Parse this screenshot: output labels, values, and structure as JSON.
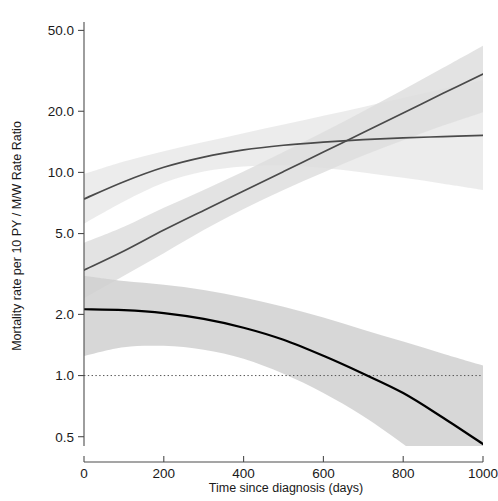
{
  "chart_data": {
    "type": "line",
    "title": "",
    "subtitle": "",
    "xlabel": "Time since diagnosis (days)",
    "ylabel": "Mortality rate per 10 PY / M/W Rate Ratio",
    "xlim": [
      0,
      1000
    ],
    "ylim": [
      0.45,
      55.0
    ],
    "yscale": "log",
    "xscale": "linear",
    "grid": false,
    "legend": null,
    "xticks": [
      0,
      200,
      400,
      600,
      800,
      1000
    ],
    "xtick_labels": [
      "0",
      "200",
      "400",
      "600",
      "800",
      "1000"
    ],
    "yticks": [
      0.5,
      1.0,
      2.0,
      5.0,
      10.0,
      20.0,
      50.0
    ],
    "ytick_labels": [
      "0.5",
      "1.0",
      "2.0",
      "5.0",
      "10.0",
      "20.0",
      "50.0"
    ],
    "reference_lines": [
      {
        "name": "null-ratio-line",
        "axis": "y",
        "value": 1.0,
        "style": "dotted",
        "color": "#555555"
      }
    ],
    "colors": {
      "men_rate_line": "#4a4a4a",
      "women_rate_line": "#4a4a4a",
      "rate_ratio_line": "#000000",
      "band_light": "#ebebeb",
      "band_mid": "#dedede",
      "band_dark": "#d0d0d0"
    },
    "series": [
      {
        "name": "Mortality rate men (per 10 PY)",
        "line_color": "#4a4a4a",
        "line_style": "solid",
        "x": [
          0,
          100,
          200,
          300,
          400,
          500,
          600,
          700,
          800,
          900,
          1000
        ],
        "values": [
          7.4,
          9.0,
          10.6,
          11.9,
          12.9,
          13.6,
          14.1,
          14.5,
          14.8,
          15.0,
          15.2
        ],
        "ci_lower": [
          5.6,
          7.2,
          8.9,
          10.1,
          10.7,
          10.8,
          10.5,
          10.0,
          9.4,
          8.8,
          8.2
        ],
        "ci_upper": [
          9.8,
          11.3,
          12.7,
          14.1,
          15.6,
          17.2,
          19.0,
          21.0,
          23.3,
          25.8,
          28.5
        ]
      },
      {
        "name": "Mortality rate women (per 10 PY)",
        "line_color": "#4a4a4a",
        "line_style": "solid",
        "x": [
          0,
          100,
          200,
          300,
          400,
          500,
          600,
          700,
          800,
          900,
          1000
        ],
        "values": [
          3.3,
          4.1,
          5.2,
          6.5,
          8.1,
          10.1,
          12.6,
          15.7,
          19.6,
          24.5,
          30.5
        ],
        "ci_lower": [
          2.4,
          3.1,
          4.0,
          5.2,
          6.6,
          8.2,
          10.0,
          12.1,
          14.4,
          17.0,
          19.8
        ],
        "ci_upper": [
          4.5,
          5.4,
          6.7,
          8.2,
          10.1,
          12.6,
          15.8,
          20.0,
          25.5,
          32.7,
          42.0
        ]
      },
      {
        "name": "M/W Rate Ratio",
        "line_color": "#000000",
        "line_style": "solid",
        "x": [
          0,
          100,
          200,
          300,
          400,
          500,
          600,
          700,
          800,
          900,
          1000
        ],
        "values": [
          2.12,
          2.1,
          2.03,
          1.9,
          1.72,
          1.5,
          1.25,
          1.02,
          0.82,
          0.62,
          0.46
        ],
        "ci_lower": [
          1.25,
          1.38,
          1.4,
          1.34,
          1.21,
          1.02,
          0.82,
          0.63,
          0.46,
          0.33,
          0.23
        ],
        "ci_upper": [
          3.1,
          2.92,
          2.8,
          2.64,
          2.42,
          2.18,
          1.93,
          1.68,
          1.47,
          1.28,
          1.12
        ]
      }
    ]
  }
}
